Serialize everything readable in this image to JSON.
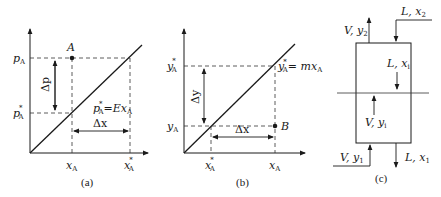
{
  "figure": {
    "panels": [
      {
        "id": "a",
        "caption": "(a)",
        "y_tick_top": {
          "main": "p",
          "sub": "A"
        },
        "y_tick_bottom": {
          "main": "p",
          "sup": "*",
          "sub": "A"
        },
        "x_tick_left": {
          "main": "x",
          "sub": "A"
        },
        "x_tick_right": {
          "main": "x",
          "sup": "*",
          "sub": "A"
        },
        "point_label": "A",
        "vertical_delta": "Δp",
        "horizontal_delta": "Δx",
        "line_equation": {
          "lhs_main": "p",
          "lhs_sup": "*",
          "lhs_sub": "A",
          "eq": "=Ex",
          "rhs_sub": "A"
        }
      },
      {
        "id": "b",
        "caption": "(b)",
        "y_tick_top": {
          "main": "y",
          "sup": "*",
          "sub": "A"
        },
        "y_tick_bottom": {
          "main": "y",
          "sub": "A"
        },
        "x_tick_left": {
          "main": "x",
          "sup": "*",
          "sub": "A"
        },
        "x_tick_right": {
          "main": "x",
          "sub": "A"
        },
        "point_label": "B",
        "vertical_delta": "Δy",
        "horizontal_delta": "Δx",
        "line_equation": {
          "lhs_main": "y",
          "lhs_sup": "*",
          "lhs_sub": "A",
          "eq": "= mx",
          "rhs_sub": "A"
        }
      },
      {
        "id": "c",
        "caption": "(c)",
        "streams": {
          "gas_out": {
            "main": "V, y",
            "sub": "2"
          },
          "liquid_in": {
            "main": "L, x",
            "sub": "2"
          },
          "liquid_internal": {
            "main": "L, x",
            "sub": "i"
          },
          "gas_internal": {
            "main": "V, y",
            "sub": "i"
          },
          "gas_in": {
            "main": "V, y",
            "sub": "1"
          },
          "liquid_out": {
            "main": "L, x",
            "sub": "1"
          }
        }
      }
    ]
  }
}
